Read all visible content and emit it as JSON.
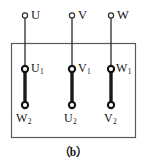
{
  "figure": {
    "caption": "（b）",
    "line_color": "#2b2b2b",
    "box_color": "#555555",
    "link_color": "#1a1a1a",
    "background": "#ffffff"
  },
  "supply_terminals": [
    {
      "label": "U",
      "x": 25,
      "y": 16
    },
    {
      "label": "V",
      "x": 72,
      "y": 16
    },
    {
      "label": "W",
      "x": 111,
      "y": 16
    }
  ],
  "upper_terminals": [
    {
      "base": "U",
      "sub": "1",
      "x": 25,
      "y": 69
    },
    {
      "base": "V",
      "sub": "1",
      "x": 72,
      "y": 69
    },
    {
      "base": "W",
      "sub": "1",
      "x": 111,
      "y": 69
    }
  ],
  "lower_terminals": [
    {
      "base": "W",
      "sub": "2",
      "x": 25,
      "y": 105
    },
    {
      "base": "U",
      "sub": "2",
      "x": 72,
      "y": 105
    },
    {
      "base": "V",
      "sub": "2",
      "x": 111,
      "y": 105
    }
  ],
  "links": [
    {
      "from": "U1",
      "to": "W2",
      "x": 25,
      "y1": 69,
      "y2": 105
    },
    {
      "from": "V1",
      "to": "U2",
      "x": 72,
      "y1": 69,
      "y2": 105
    },
    {
      "from": "W1",
      "to": "V2",
      "x": 111,
      "y1": 69,
      "y2": 105
    }
  ],
  "terminal_box": {
    "x": 11,
    "y": 43,
    "width": 125,
    "height": 95
  }
}
